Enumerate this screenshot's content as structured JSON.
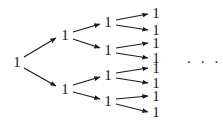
{
  "figure": {
    "name": "binary-tree-of-ones",
    "background_color": "#ffffff",
    "ink_color": "#1a1a1a",
    "width": 223,
    "height": 121,
    "continuation": {
      "text": "· · ·",
      "x": 204,
      "y": 62
    }
  },
  "nodes": [
    {
      "id": "n0",
      "label": "1",
      "level": 0,
      "x": 17,
      "y": 62
    },
    {
      "id": "n1",
      "label": "1",
      "level": 1,
      "x": 65,
      "y": 35
    },
    {
      "id": "n2",
      "label": "1",
      "level": 1,
      "x": 65,
      "y": 89
    },
    {
      "id": "n3",
      "label": "1",
      "level": 2,
      "x": 108,
      "y": 22
    },
    {
      "id": "n4",
      "label": "1",
      "level": 2,
      "x": 108,
      "y": 50
    },
    {
      "id": "n5",
      "label": "1",
      "level": 2,
      "x": 108,
      "y": 75
    },
    {
      "id": "n6",
      "label": "1",
      "level": 2,
      "x": 108,
      "y": 101
    },
    {
      "id": "n7",
      "label": "1",
      "level": 3,
      "x": 156,
      "y": 13
    },
    {
      "id": "n8",
      "label": "1",
      "level": 3,
      "x": 156,
      "y": 30
    },
    {
      "id": "n9",
      "label": "1",
      "level": 3,
      "x": 156,
      "y": 43
    },
    {
      "id": "n10",
      "label": "1",
      "level": 3,
      "x": 156,
      "y": 58
    },
    {
      "id": "n11",
      "label": "1",
      "level": 3,
      "x": 156,
      "y": 68
    },
    {
      "id": "n12",
      "label": "1",
      "level": 3,
      "x": 156,
      "y": 83
    },
    {
      "id": "n13",
      "label": "1",
      "level": 3,
      "x": 156,
      "y": 96
    },
    {
      "id": "n14",
      "label": "1",
      "level": 3,
      "x": 156,
      "y": 112
    }
  ],
  "edges": [
    {
      "from": "n0",
      "to": "n1",
      "x1": 24,
      "y1": 57,
      "x2": 56,
      "y2": 38
    },
    {
      "from": "n0",
      "to": "n2",
      "x1": 24,
      "y1": 68,
      "x2": 56,
      "y2": 86
    },
    {
      "from": "n1",
      "to": "n3",
      "x1": 73,
      "y1": 32,
      "x2": 100,
      "y2": 24
    },
    {
      "from": "n1",
      "to": "n4",
      "x1": 73,
      "y1": 39,
      "x2": 100,
      "y2": 48
    },
    {
      "from": "n2",
      "to": "n5",
      "x1": 73,
      "y1": 85,
      "x2": 100,
      "y2": 77
    },
    {
      "from": "n2",
      "to": "n6",
      "x1": 73,
      "y1": 92,
      "x2": 100,
      "y2": 99
    },
    {
      "from": "n3",
      "to": "n7",
      "x1": 116,
      "y1": 20,
      "x2": 148,
      "y2": 14
    },
    {
      "from": "n3",
      "to": "n8",
      "x1": 116,
      "y1": 25,
      "x2": 148,
      "y2": 30
    },
    {
      "from": "n4",
      "to": "n9",
      "x1": 116,
      "y1": 48,
      "x2": 148,
      "y2": 43
    },
    {
      "from": "n4",
      "to": "n10",
      "x1": 116,
      "y1": 53,
      "x2": 148,
      "y2": 58
    },
    {
      "from": "n5",
      "to": "n11",
      "x1": 116,
      "y1": 73,
      "x2": 148,
      "y2": 68
    },
    {
      "from": "n5",
      "to": "n12",
      "x1": 116,
      "y1": 78,
      "x2": 148,
      "y2": 83
    },
    {
      "from": "n6",
      "to": "n13",
      "x1": 116,
      "y1": 99,
      "x2": 148,
      "y2": 96
    },
    {
      "from": "n6",
      "to": "n14",
      "x1": 116,
      "y1": 104,
      "x2": 148,
      "y2": 112
    }
  ]
}
